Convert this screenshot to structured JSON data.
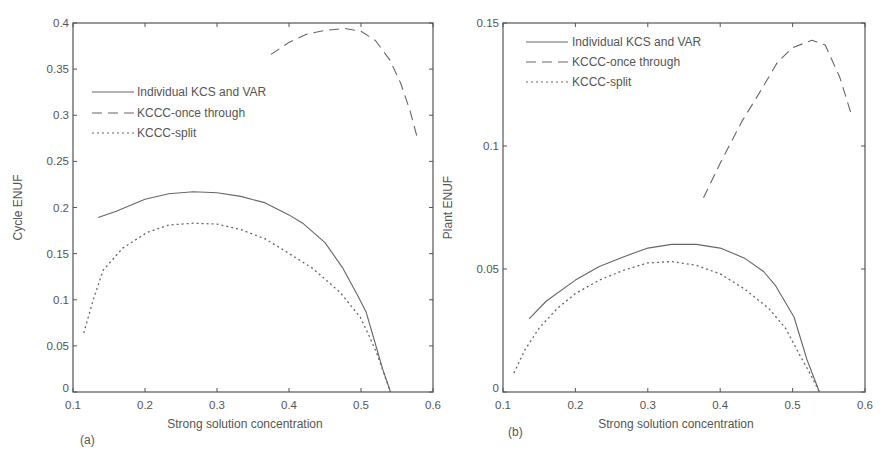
{
  "chart_data": [
    {
      "type": "line",
      "panel_label": "(a)",
      "xlabel": "Strong solution concentration",
      "ylabel": "Cycle ENUF",
      "xlim": [
        0.1,
        0.6
      ],
      "ylim": [
        0,
        0.4
      ],
      "xticks": [
        0.1,
        0.2,
        0.3,
        0.4,
        0.5,
        0.6
      ],
      "xtick_labels": [
        "0.1",
        "0.2",
        "0.3",
        "0.4",
        "0.5",
        "0.6"
      ],
      "yticks": [
        0,
        0.05,
        0.1,
        0.15,
        0.2,
        0.25,
        0.3,
        0.35,
        0.4
      ],
      "ytick_labels": [
        "0",
        "0.05",
        "0.1",
        "0.15",
        "0.2",
        "0.25",
        "0.3",
        "0.35",
        "0.4"
      ],
      "grid": false,
      "legend_position": "upper-left",
      "series": [
        {
          "name": "Individual KCS and VAR",
          "style": "solid",
          "x": [
            0.135,
            0.16,
            0.2,
            0.233,
            0.267,
            0.3,
            0.333,
            0.367,
            0.4,
            0.419,
            0.45,
            0.475,
            0.495,
            0.507,
            0.52,
            0.53,
            0.541
          ],
          "y": [
            0.189,
            0.196,
            0.209,
            0.215,
            0.217,
            0.216,
            0.212,
            0.205,
            0.192,
            0.183,
            0.162,
            0.134,
            0.105,
            0.087,
            0.052,
            0.025,
            0.0
          ]
        },
        {
          "name": "KCCC-once through",
          "style": "dashed",
          "x": [
            0.375,
            0.4,
            0.425,
            0.45,
            0.478,
            0.5,
            0.52,
            0.54,
            0.555,
            0.568,
            0.579
          ],
          "y": [
            0.366,
            0.379,
            0.388,
            0.392,
            0.394,
            0.391,
            0.381,
            0.36,
            0.335,
            0.305,
            0.273
          ]
        },
        {
          "name": "KCCC-split",
          "style": "dotted",
          "x": [
            0.115,
            0.128,
            0.142,
            0.169,
            0.203,
            0.233,
            0.267,
            0.3,
            0.333,
            0.367,
            0.388,
            0.433,
            0.471,
            0.499,
            0.51,
            0.522,
            0.532,
            0.541
          ],
          "y": [
            0.064,
            0.1,
            0.132,
            0.156,
            0.173,
            0.181,
            0.183,
            0.182,
            0.176,
            0.166,
            0.156,
            0.134,
            0.108,
            0.081,
            0.063,
            0.042,
            0.02,
            0.0
          ]
        }
      ]
    },
    {
      "type": "line",
      "panel_label": "(b)",
      "xlabel": "Strong solution concentration",
      "ylabel": "Plant ENUF",
      "xlim": [
        0.1,
        0.6
      ],
      "ylim": [
        0,
        0.15
      ],
      "xticks": [
        0.1,
        0.2,
        0.3,
        0.4,
        0.5,
        0.6
      ],
      "xtick_labels": [
        "0.1",
        "0.2",
        "0.3",
        "0.4",
        "0.5",
        "0.6"
      ],
      "yticks": [
        0,
        0.05,
        0.1,
        0.15
      ],
      "ytick_labels": [
        "0",
        "0.05",
        "0.1",
        "0.15"
      ],
      "grid": false,
      "legend_position": "upper-left",
      "series": [
        {
          "name": "Individual KCS and VAR",
          "style": "solid",
          "x": [
            0.136,
            0.16,
            0.2,
            0.233,
            0.267,
            0.3,
            0.333,
            0.367,
            0.4,
            0.433,
            0.46,
            0.477,
            0.502,
            0.52,
            0.537
          ],
          "y": [
            0.0297,
            0.037,
            0.0455,
            0.051,
            0.055,
            0.0585,
            0.06,
            0.06,
            0.0585,
            0.0545,
            0.049,
            0.043,
            0.0305,
            0.013,
            0.0
          ]
        },
        {
          "name": "KCCC-once through",
          "style": "dashed",
          "x": [
            0.377,
            0.4,
            0.43,
            0.455,
            0.479,
            0.5,
            0.527,
            0.545,
            0.565,
            0.581
          ],
          "y": [
            0.079,
            0.093,
            0.11,
            0.122,
            0.134,
            0.14,
            0.143,
            0.141,
            0.128,
            0.113
          ]
        },
        {
          "name": "KCCC-split",
          "style": "dotted",
          "x": [
            0.115,
            0.13,
            0.15,
            0.175,
            0.2,
            0.233,
            0.267,
            0.3,
            0.333,
            0.367,
            0.4,
            0.433,
            0.467,
            0.49,
            0.51,
            0.525,
            0.537
          ],
          "y": [
            0.0077,
            0.017,
            0.026,
            0.034,
            0.04,
            0.0455,
            0.0495,
            0.0525,
            0.053,
            0.0515,
            0.048,
            0.042,
            0.034,
            0.026,
            0.015,
            0.007,
            0.0
          ]
        }
      ]
    }
  ]
}
